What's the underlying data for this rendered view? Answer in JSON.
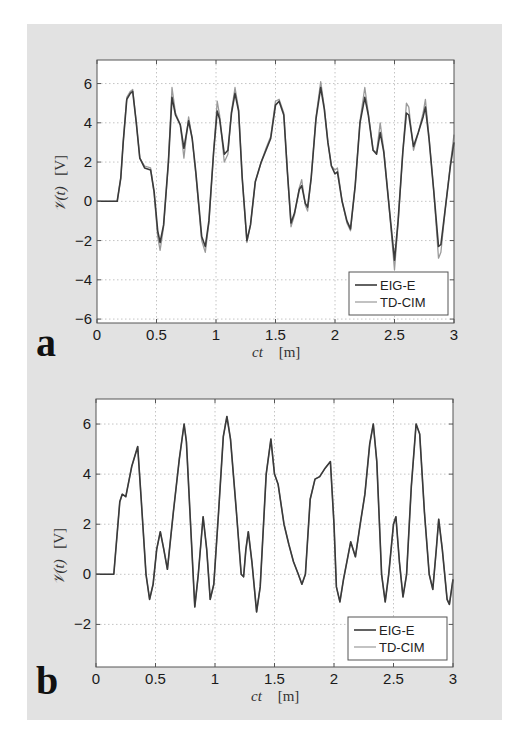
{
  "figure": {
    "background": "#e2e2e2",
    "series_colors": {
      "EIG-E": "#3a3a3a",
      "TD-CIM": "#9a9a9a"
    }
  },
  "chart_data": [
    {
      "panel": "a",
      "type": "line",
      "title": "",
      "xlabel": "ct",
      "xlabel_unit": "[m]",
      "ylabel": "𝒱(t)",
      "ylabel_unit": "[V]",
      "xlim": [
        0,
        3
      ],
      "ylim": [
        -6.2,
        7.2
      ],
      "xticks": [
        0,
        0.5,
        1,
        1.5,
        2,
        2.5,
        3
      ],
      "xtick_labels": [
        "0",
        "0.5",
        "1",
        "1.5",
        "2",
        "2.5",
        "3"
      ],
      "yticks": [
        -6,
        -4,
        -2,
        0,
        2,
        4,
        6
      ],
      "ytick_labels": [
        "−6",
        "−4",
        "−2",
        "0",
        "2",
        "4",
        "6"
      ],
      "grid": true,
      "legend": {
        "position": "lower right",
        "entries": [
          "EIG-E",
          "TD-CIM"
        ]
      },
      "series": [
        {
          "name": "EIG-E",
          "x": [
            0,
            0.17,
            0.2,
            0.22,
            0.25,
            0.28,
            0.3,
            0.33,
            0.36,
            0.4,
            0.45,
            0.48,
            0.51,
            0.53,
            0.56,
            0.6,
            0.63,
            0.66,
            0.7,
            0.73,
            0.77,
            0.8,
            0.83,
            0.88,
            0.91,
            0.94,
            0.98,
            1.01,
            1.03,
            1.07,
            1.1,
            1.13,
            1.16,
            1.19,
            1.22,
            1.26,
            1.29,
            1.33,
            1.38,
            1.42,
            1.46,
            1.5,
            1.53,
            1.57,
            1.6,
            1.63,
            1.66,
            1.7,
            1.72,
            1.75,
            1.77,
            1.8,
            1.84,
            1.88,
            1.91,
            1.94,
            1.97,
            2.0,
            2.02,
            2.06,
            2.1,
            2.13,
            2.17,
            2.21,
            2.25,
            2.28,
            2.32,
            2.35,
            2.38,
            2.41,
            2.45,
            2.5,
            2.53,
            2.57,
            2.6,
            2.62,
            2.66,
            2.7,
            2.74,
            2.76,
            2.79,
            2.83,
            2.87,
            2.89,
            2.93,
            2.97,
            3.0
          ],
          "y": [
            0,
            0,
            1.2,
            3.0,
            5.2,
            5.5,
            5.6,
            4.0,
            2.2,
            1.7,
            1.6,
            0.5,
            -1.5,
            -2.1,
            -1.2,
            2.0,
            5.3,
            4.4,
            3.9,
            2.7,
            4.1,
            3.2,
            1.5,
            -1.8,
            -2.3,
            -1.0,
            2.5,
            4.6,
            4.2,
            2.4,
            2.6,
            4.5,
            5.5,
            4.6,
            1.2,
            -2.0,
            -1.2,
            1.0,
            2.0,
            2.6,
            3.2,
            4.9,
            5.1,
            4.4,
            1.5,
            -1.1,
            -0.6,
            0.6,
            0.8,
            -0.1,
            -0.3,
            1.2,
            4.2,
            5.8,
            4.7,
            3.0,
            1.8,
            1.4,
            1.5,
            0.0,
            -1.0,
            -1.4,
            0.8,
            4.0,
            5.3,
            4.4,
            2.6,
            2.4,
            3.5,
            2.5,
            0.0,
            -3.0,
            -1.0,
            2.5,
            4.5,
            4.4,
            2.8,
            3.5,
            4.3,
            4.8,
            3.2,
            0.5,
            -2.3,
            -2.2,
            -0.2,
            1.8,
            3.0
          ]
        },
        {
          "name": "TD-CIM",
          "x": [
            0,
            0.17,
            0.2,
            0.22,
            0.25,
            0.28,
            0.3,
            0.33,
            0.36,
            0.4,
            0.45,
            0.48,
            0.51,
            0.53,
            0.56,
            0.6,
            0.63,
            0.66,
            0.7,
            0.73,
            0.77,
            0.8,
            0.83,
            0.88,
            0.91,
            0.94,
            0.98,
            1.01,
            1.03,
            1.07,
            1.1,
            1.13,
            1.16,
            1.19,
            1.22,
            1.26,
            1.29,
            1.33,
            1.38,
            1.42,
            1.46,
            1.5,
            1.53,
            1.57,
            1.6,
            1.63,
            1.66,
            1.7,
            1.72,
            1.75,
            1.77,
            1.8,
            1.84,
            1.88,
            1.91,
            1.94,
            1.97,
            2.0,
            2.02,
            2.06,
            2.1,
            2.13,
            2.17,
            2.21,
            2.25,
            2.28,
            2.32,
            2.35,
            2.38,
            2.41,
            2.45,
            2.5,
            2.53,
            2.57,
            2.6,
            2.62,
            2.66,
            2.7,
            2.74,
            2.76,
            2.79,
            2.83,
            2.87,
            2.89,
            2.93,
            2.97,
            3.0
          ],
          "y": [
            0,
            0,
            1.2,
            3.0,
            5.3,
            5.6,
            5.7,
            4.0,
            2.2,
            1.8,
            1.7,
            0.4,
            -1.8,
            -2.5,
            -1.3,
            2.0,
            5.8,
            4.5,
            3.9,
            2.2,
            4.3,
            3.2,
            1.4,
            -2.0,
            -2.6,
            -1.1,
            2.5,
            5.1,
            4.4,
            2.0,
            2.4,
            4.6,
            5.8,
            4.7,
            1.2,
            -2.1,
            -1.2,
            1.0,
            2.0,
            2.7,
            3.3,
            5.1,
            5.2,
            4.5,
            1.5,
            -1.3,
            -0.7,
            0.7,
            1.1,
            -0.2,
            -0.5,
            1.2,
            4.3,
            6.1,
            4.8,
            3.0,
            1.8,
            1.6,
            1.7,
            0.0,
            -1.1,
            -1.5,
            0.8,
            4.1,
            5.8,
            4.5,
            2.6,
            2.5,
            4.0,
            2.6,
            0.0,
            -3.5,
            -1.1,
            2.5,
            5.0,
            4.8,
            2.6,
            3.5,
            4.5,
            5.2,
            3.3,
            0.5,
            -2.9,
            -2.6,
            -0.2,
            1.9,
            3.4
          ]
        }
      ]
    },
    {
      "panel": "b",
      "type": "line",
      "title": "",
      "xlabel": "ct",
      "xlabel_unit": "[m]",
      "ylabel": "𝒱(t)",
      "ylabel_unit": "[V]",
      "xlim": [
        0,
        3
      ],
      "ylim": [
        -3.7,
        7.0
      ],
      "xticks": [
        0,
        0.5,
        1,
        1.5,
        2,
        2.5,
        3
      ],
      "xtick_labels": [
        "0",
        "0.5",
        "1",
        "1.5",
        "2",
        "2.5",
        "3"
      ],
      "yticks": [
        -2,
        0,
        2,
        4,
        6
      ],
      "ytick_labels": [
        "−2",
        "0",
        "2",
        "4",
        "6"
      ],
      "grid": true,
      "legend": {
        "position": "lower right",
        "entries": [
          "EIG-E",
          "TD-CIM"
        ]
      },
      "series": [
        {
          "name": "EIG-E",
          "x": [
            0,
            0.15,
            0.2,
            0.22,
            0.25,
            0.3,
            0.35,
            0.38,
            0.42,
            0.45,
            0.48,
            0.51,
            0.54,
            0.57,
            0.6,
            0.65,
            0.7,
            0.74,
            0.76,
            0.8,
            0.83,
            0.86,
            0.9,
            0.93,
            0.96,
            0.99,
            1.03,
            1.07,
            1.1,
            1.13,
            1.18,
            1.22,
            1.24,
            1.26,
            1.28,
            1.31,
            1.35,
            1.38,
            1.43,
            1.47,
            1.5,
            1.53,
            1.58,
            1.62,
            1.66,
            1.7,
            1.73,
            1.76,
            1.8,
            1.84,
            1.88,
            1.92,
            1.97,
            2.0,
            2.02,
            2.05,
            2.08,
            2.12,
            2.14,
            2.18,
            2.22,
            2.26,
            2.3,
            2.33,
            2.36,
            2.4,
            2.43,
            2.46,
            2.5,
            2.52,
            2.55,
            2.58,
            2.61,
            2.65,
            2.69,
            2.72,
            2.76,
            2.8,
            2.83,
            2.86,
            2.88,
            2.91,
            2.95,
            2.97,
            3.0
          ],
          "y": [
            0,
            0,
            2.9,
            3.2,
            3.1,
            4.3,
            5.1,
            3.0,
            0.0,
            -1.0,
            -0.4,
            1.0,
            1.7,
            1.0,
            0.2,
            2.5,
            4.6,
            6.0,
            5.3,
            1.5,
            -1.3,
            0.0,
            2.3,
            1.0,
            -1.0,
            -0.4,
            2.5,
            5.5,
            6.3,
            5.4,
            2.5,
            0.0,
            -0.1,
            1.0,
            1.7,
            0.5,
            -1.5,
            -0.5,
            4.0,
            5.4,
            4.0,
            3.6,
            2.0,
            1.2,
            0.5,
            0.0,
            -0.4,
            0.0,
            3.0,
            3.8,
            3.9,
            4.2,
            4.5,
            2.0,
            -0.5,
            -1.1,
            -0.2,
            0.8,
            1.3,
            0.7,
            2.0,
            3.2,
            5.2,
            6.0,
            4.5,
            0.0,
            -1.1,
            0.0,
            2.0,
            2.3,
            0.5,
            -0.9,
            0.0,
            3.5,
            6.0,
            5.6,
            2.5,
            0.0,
            -0.6,
            1.0,
            2.2,
            1.0,
            -1.0,
            -1.2,
            -0.2
          ]
        },
        {
          "name": "TD-CIM",
          "x": [
            0,
            0.15,
            0.2,
            0.22,
            0.25,
            0.3,
            0.35,
            0.38,
            0.42,
            0.45,
            0.48,
            0.51,
            0.54,
            0.57,
            0.6,
            0.65,
            0.7,
            0.74,
            0.76,
            0.8,
            0.83,
            0.86,
            0.9,
            0.93,
            0.96,
            0.99,
            1.03,
            1.07,
            1.1,
            1.13,
            1.18,
            1.22,
            1.24,
            1.26,
            1.28,
            1.31,
            1.35,
            1.38,
            1.43,
            1.47,
            1.5,
            1.53,
            1.58,
            1.62,
            1.66,
            1.7,
            1.73,
            1.76,
            1.8,
            1.84,
            1.88,
            1.92,
            1.97,
            2.0,
            2.02,
            2.05,
            2.08,
            2.12,
            2.14,
            2.18,
            2.22,
            2.26,
            2.3,
            2.33,
            2.36,
            2.4,
            2.43,
            2.46,
            2.5,
            2.52,
            2.55,
            2.58,
            2.61,
            2.65,
            2.69,
            2.72,
            2.76,
            2.8,
            2.83,
            2.86,
            2.88,
            2.91,
            2.95,
            2.97,
            3.0
          ],
          "y": [
            0,
            0,
            2.9,
            3.2,
            3.1,
            4.3,
            5.1,
            3.0,
            0.0,
            -1.0,
            -0.4,
            1.0,
            1.7,
            1.0,
            0.2,
            2.5,
            4.6,
            6.0,
            5.3,
            1.5,
            -1.3,
            0.0,
            2.3,
            1.0,
            -1.0,
            -0.4,
            2.5,
            5.5,
            6.3,
            5.4,
            2.5,
            0.0,
            -0.1,
            1.0,
            1.7,
            0.5,
            -1.5,
            -0.5,
            4.0,
            5.4,
            4.0,
            3.6,
            2.0,
            1.2,
            0.5,
            0.0,
            -0.4,
            0.0,
            3.0,
            3.8,
            3.9,
            4.2,
            4.5,
            2.0,
            -0.5,
            -1.1,
            -0.2,
            0.8,
            1.3,
            0.7,
            2.0,
            3.2,
            5.2,
            6.0,
            4.5,
            0.0,
            -1.1,
            0.0,
            2.0,
            2.3,
            0.5,
            -0.9,
            0.0,
            3.5,
            6.0,
            5.6,
            2.5,
            0.0,
            -0.6,
            1.0,
            2.2,
            1.0,
            -1.0,
            -1.2,
            -0.2
          ]
        }
      ]
    }
  ],
  "layout_px": [
    {
      "plot": {
        "left": 97,
        "top": 60,
        "right": 454,
        "bottom": 323
      },
      "letter_pos": [
        36,
        356
      ],
      "legend": {
        "left": 349,
        "top": 272,
        "width": 99,
        "height": 43
      }
    },
    {
      "plot": {
        "left": 96,
        "top": 399,
        "right": 453,
        "bottom": 667
      },
      "letter_pos": [
        36,
        694
      ],
      "legend": {
        "left": 348,
        "top": 617,
        "width": 99,
        "height": 43
      }
    }
  ]
}
